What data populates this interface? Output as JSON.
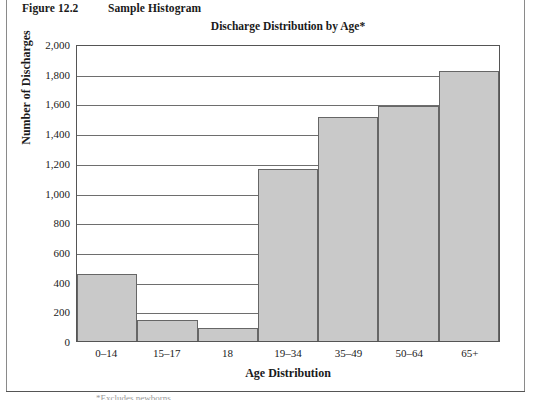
{
  "figure": {
    "number": "Figure 12.2",
    "caption": "Sample Histogram"
  },
  "footnote": "*Excludes newborns.",
  "chart_data": {
    "type": "bar",
    "title": "Discharge Distribution by Age*",
    "xlabel": "Age Distribution",
    "ylabel": "Number of Discharges",
    "categories": [
      "0–14",
      "15–17",
      "18",
      "19–34",
      "35–49",
      "50–64",
      "65+"
    ],
    "values": [
      450,
      140,
      90,
      1155,
      1510,
      1580,
      1820
    ],
    "ylim": [
      0,
      2000
    ],
    "yticks": [
      2000,
      1800,
      1600,
      1400,
      1200,
      1000,
      800,
      600,
      400,
      200,
      0
    ],
    "ytick_labels": [
      "2,000",
      "1,800",
      "1,600",
      "1,400",
      "1,200",
      "1,000",
      "800",
      "600",
      "400",
      "200",
      "0"
    ],
    "grid": true,
    "legend": false,
    "bar_fill_color": "#c9c9c9",
    "bar_border_color": "#666666",
    "gridline_color": "#6e6e6e",
    "plot_border_color": "#555555"
  }
}
